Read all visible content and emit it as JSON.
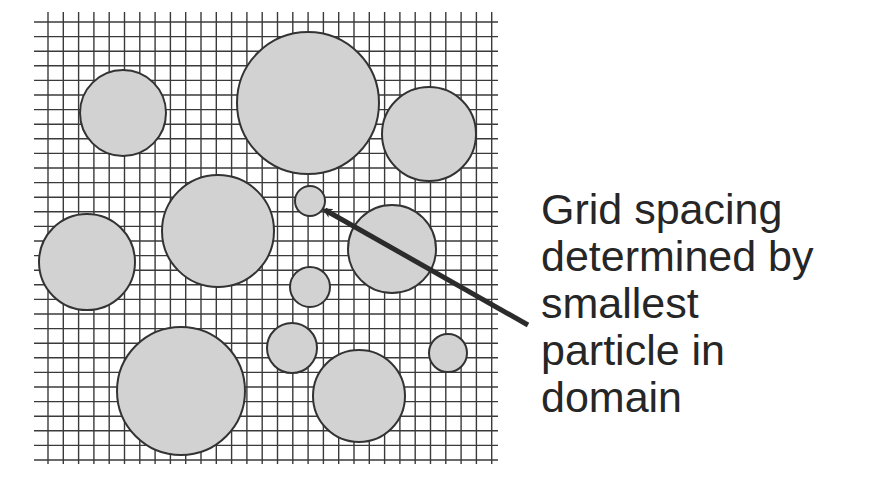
{
  "caption": {
    "lines": [
      "Grid spacing",
      "determined by",
      "smallest",
      "particle in",
      "domain"
    ]
  },
  "colors": {
    "grid_line": "#3a3a3a",
    "particle_fill": "#d2d2d2",
    "particle_stroke": "#333333",
    "arrow": "#2b2b2b",
    "text": "#262626",
    "background": "#ffffff"
  },
  "grid": {
    "x_start": 48,
    "x_end": 497,
    "x_step": 15.3,
    "y_start": 22,
    "y_end": 462,
    "y_step": 14.6,
    "h_line_x0": 34,
    "h_line_x1": 498,
    "v_line_y0": 12,
    "v_line_y1": 464
  },
  "particles": [
    {
      "id": "p1",
      "cx": 123,
      "cy": 113,
      "r": 43
    },
    {
      "id": "p2",
      "cx": 308,
      "cy": 103,
      "r": 71
    },
    {
      "id": "p3",
      "cx": 429,
      "cy": 134,
      "r": 47
    },
    {
      "id": "p4-smallest",
      "cx": 310,
      "cy": 201,
      "r": 15
    },
    {
      "id": "p5",
      "cx": 218,
      "cy": 231,
      "r": 56
    },
    {
      "id": "p6",
      "cx": 392,
      "cy": 249,
      "r": 44
    },
    {
      "id": "p7",
      "cx": 87,
      "cy": 262,
      "r": 48
    },
    {
      "id": "p8",
      "cx": 310,
      "cy": 287,
      "r": 20
    },
    {
      "id": "p9",
      "cx": 181,
      "cy": 391,
      "r": 64
    },
    {
      "id": "p10",
      "cx": 292,
      "cy": 348,
      "r": 25
    },
    {
      "id": "p11",
      "cx": 359,
      "cy": 396,
      "r": 46
    },
    {
      "id": "p12",
      "cx": 448,
      "cy": 353,
      "r": 19
    }
  ],
  "arrow": {
    "x1": 528,
    "y1": 325,
    "x2": 325,
    "y2": 210
  }
}
